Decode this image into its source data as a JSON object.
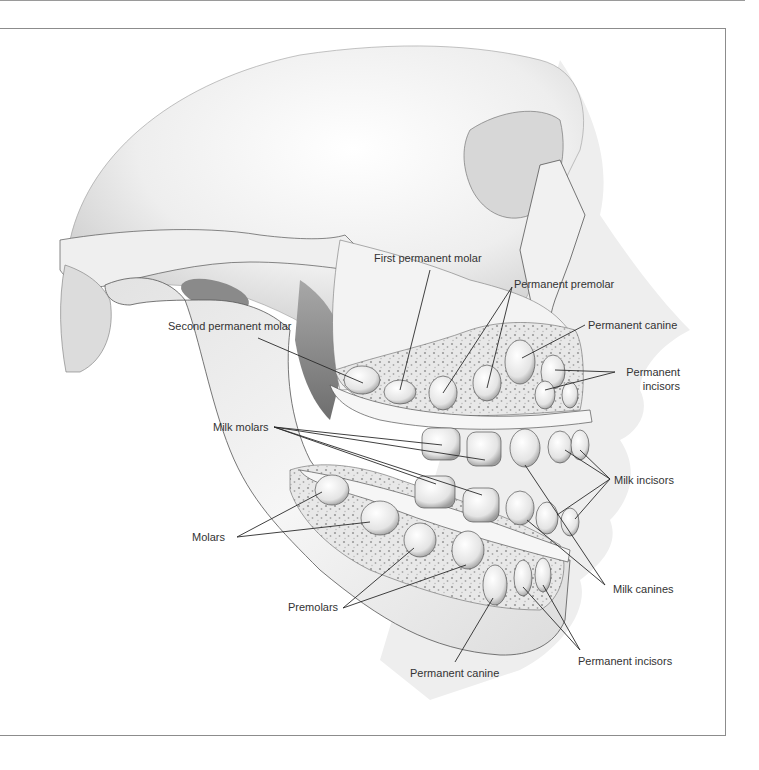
{
  "figure": {
    "colors": {
      "bone_light": "#f4f4f4",
      "bone_mid": "#d6d6d6",
      "bone_shadow": "#9a9a9a",
      "outline": "#555555",
      "label_text": "#333333",
      "leader_line": "#2a2a2a",
      "frame": "#8c8c8c",
      "face_silhouette": "#ededed"
    },
    "labels": {
      "first_permanent_molar": "First permanent molar",
      "permanent_premolar": "Permanent premolar",
      "second_permanent_molar": "Second permanent molar",
      "permanent_canine_upper": "Permanent canine",
      "permanent_incisors_upper_line1": "Permanent",
      "permanent_incisors_upper_line2": "incisors",
      "milk_molars": "Milk molars",
      "milk_incisors": "Milk incisors",
      "molars": "Molars",
      "milk_canines": "Milk canines",
      "premolars": "Premolars",
      "permanent_canine_lower": "Permanent canine",
      "permanent_incisors_lower": "Permanent incisors"
    }
  }
}
